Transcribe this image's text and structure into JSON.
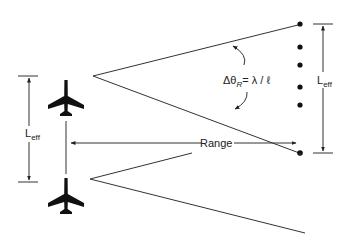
{
  "diagram": {
    "labels": {
      "angle_formula_prefix": "Δθ",
      "angle_formula_sub": "R",
      "angle_formula_suffix": "= λ / ℓ",
      "range": "Range",
      "l_eff_right_main": "L",
      "l_eff_right_sub": "eff",
      "l_eff_left_main": "L",
      "l_eff_left_sub": "eff"
    },
    "icons": {
      "aircraft_top": "airplane-icon",
      "aircraft_bottom": "airplane-icon"
    },
    "array_elements": 6,
    "colors": {
      "line": "#333333",
      "fill": "#111111"
    }
  }
}
